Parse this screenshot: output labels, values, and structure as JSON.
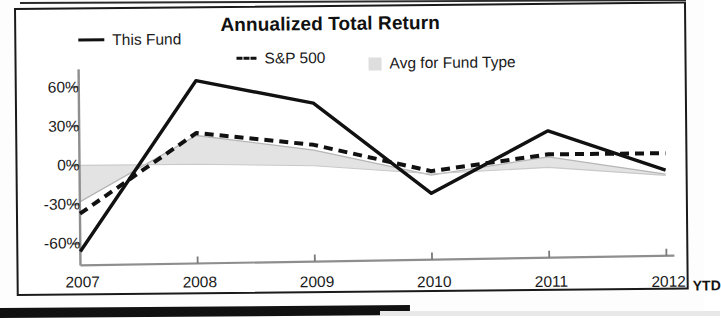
{
  "chart_data": {
    "type": "line",
    "title": "Annualized Total Return",
    "xlabel": "",
    "ylabel": "",
    "x": [
      "2007",
      "2008",
      "2009",
      "2010",
      "2011",
      "2012"
    ],
    "categories": [
      "2007",
      "2008",
      "2009",
      "2010",
      "2011",
      "2012"
    ],
    "x_tick_labels": [
      "2007",
      "2008",
      "2009",
      "2010",
      "2011",
      "2012"
    ],
    "x_axis_note": "YTD",
    "y_tick_labels": [
      "60%",
      "30%",
      "0%",
      "-30%",
      "-60%"
    ],
    "y_ticks": [
      60,
      30,
      0,
      -30,
      -60
    ],
    "ylim": [
      -72,
      72
    ],
    "grid": false,
    "legend_position": "top",
    "series": [
      {
        "name": "This Fund",
        "style": "solid",
        "color": "#111111",
        "values": [
          -66,
          64,
          46,
          -24,
          23,
          -8
        ]
      },
      {
        "name": "S&P 500",
        "style": "dashed",
        "color": "#111111",
        "values": [
          -37,
          24,
          14,
          -7,
          5,
          5
        ]
      },
      {
        "name": "Avg for Fund Type",
        "style": "area",
        "color": "#dedede",
        "values": [
          -28,
          22,
          10,
          -10,
          3,
          -11
        ],
        "baseline_values": [
          0,
          0,
          -2,
          -9,
          -5,
          -12
        ]
      }
    ]
  },
  "legend": {
    "items": [
      {
        "label": "This Fund",
        "icon": "solid-line-swatch"
      },
      {
        "label": "S&P 500",
        "icon": "dashed-line-swatch"
      },
      {
        "label": "Avg for Fund Type",
        "icon": "area-swatch"
      }
    ]
  }
}
